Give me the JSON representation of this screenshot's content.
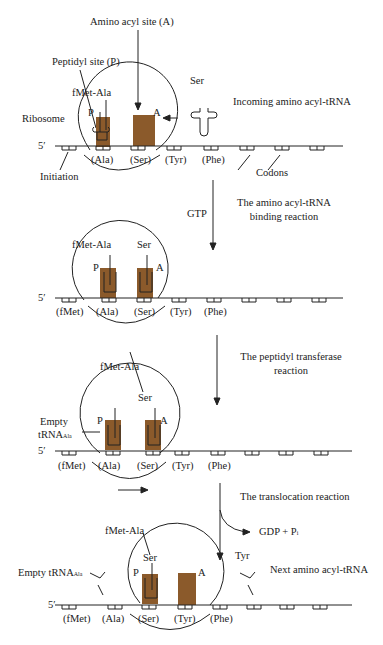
{
  "colors": {
    "ribosome_site": "#8b5a2b",
    "line": "#222222",
    "background": "#ffffff"
  },
  "labels": {
    "amino_acyl_site": "Amino acyl site (A)",
    "peptidyl_site": "Peptidyl site (P)",
    "ribosome": "Ribosome",
    "incoming": "Incoming amino acyl-tRNA",
    "initiation": "Initiation",
    "codons": "Codons",
    "five_prime": "5′",
    "P": "P",
    "A": "A"
  },
  "steps": [
    {
      "reaction": "The amino acyl-tRNA binding reaction",
      "cofactor": "GTP"
    },
    {
      "reaction": "The peptidyl transferase reaction"
    },
    {
      "reaction": "The translocation reaction",
      "products": "GDP + P"
    }
  ],
  "panels": [
    {
      "peptide": "fMet-Ala",
      "incoming": "Ser",
      "codon_labels": [
        "(Ala)",
        "(Ser)",
        "(Tyr)",
        "(Phe)"
      ]
    },
    {
      "peptide": "fMet-Ala",
      "aa_trna": "Ser",
      "codon_labels": [
        "(fMet)",
        "(Ala)",
        "(Ser)",
        "(Tyr)",
        "(Phe)"
      ]
    },
    {
      "peptide": "fMet-Ala",
      "aa_trna": "Ser",
      "empty": "Empty",
      "empty_trna": "tRNA",
      "empty_sub": "Ala",
      "codon_labels": [
        "(fMet)",
        "(Ala)",
        "(Ser)",
        "(Tyr)",
        "(Phe)"
      ]
    },
    {
      "peptide": "fMet-Ala",
      "aa_trna": "Ser",
      "empty_trna": "Empty tRNA",
      "empty_sub": "Ala",
      "next": "Tyr",
      "next_label": "Next amino acyl-tRNA",
      "codon_labels": [
        "(fMet)",
        "(Ala)",
        "(Ser)",
        "(Tyr)",
        "(Phe)"
      ]
    }
  ],
  "pi_sub": "i"
}
